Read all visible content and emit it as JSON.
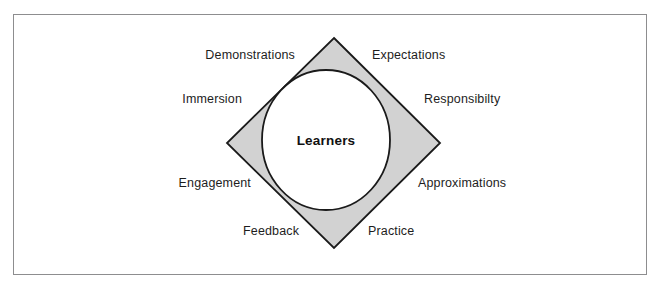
{
  "figure": {
    "center_label": "Learners",
    "labels": [
      {
        "id": "demonstrations",
        "text": "Demonstrations",
        "x": 195,
        "y": 49,
        "align": "right",
        "width": 100
      },
      {
        "id": "expectations",
        "text": "Expectations",
        "x": 372,
        "y": 49,
        "align": "left",
        "width": 100
      },
      {
        "id": "immersion",
        "text": "Immersion",
        "x": 180,
        "y": 93,
        "align": "right",
        "width": 62
      },
      {
        "id": "responsibility",
        "text": "Responsibilty",
        "x": 424,
        "y": 93,
        "align": "left",
        "width": 90
      },
      {
        "id": "engagement",
        "text": "Engagement",
        "x": 173,
        "y": 177,
        "align": "right",
        "width": 78
      },
      {
        "id": "approximations",
        "text": "Approximations",
        "x": 418,
        "y": 177,
        "align": "left",
        "width": 100
      },
      {
        "id": "feedback",
        "text": "Feedback",
        "x": 243,
        "y": 225,
        "align": "right",
        "width": 55
      },
      {
        "id": "practice",
        "text": "Practice",
        "x": 368,
        "y": 225,
        "align": "left",
        "width": 55
      }
    ],
    "shapes": {
      "diamond": {
        "top": {
          "x": 334,
          "y": 38
        },
        "right": {
          "x": 440,
          "y": 143
        },
        "bottom": {
          "x": 334,
          "y": 248
        },
        "left": {
          "x": 227,
          "y": 143
        },
        "fill": "#d2d2d2",
        "stroke": "#1a1a1a"
      },
      "circle": {
        "cx": 326,
        "cy": 140,
        "rx": 64,
        "ry": 70,
        "fill": "#ffffff",
        "stroke": "#1a1a1a"
      }
    },
    "frame": {
      "stroke": "#8d8d8f"
    }
  }
}
